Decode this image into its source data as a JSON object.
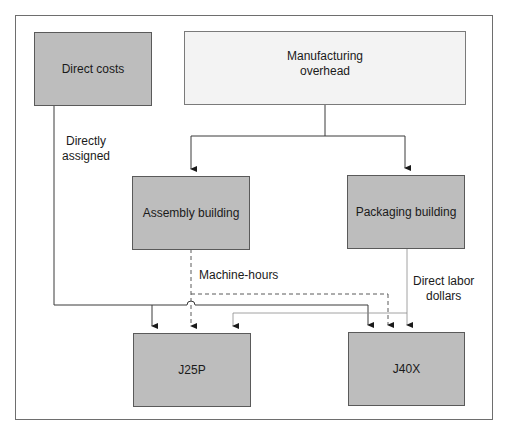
{
  "diagram": {
    "nodes": {
      "direct_costs": {
        "label": "Direct costs"
      },
      "manufacturing_overhead": {
        "label_line1": "Manufacturing",
        "label_line2": "overhead"
      },
      "assembly_building": {
        "label": "Assembly building"
      },
      "packaging_building": {
        "label": "Packaging building"
      },
      "j25p": {
        "label": "J25P"
      },
      "j40x": {
        "label": "J40X"
      }
    },
    "edge_labels": {
      "directly_assigned_line1": "Directly",
      "directly_assigned_line2": "assigned",
      "machine_hours": "Machine-hours",
      "direct_labor_line1": "Direct labor",
      "direct_labor_line2": "dollars"
    },
    "edges": [
      {
        "from": "Manufacturing overhead",
        "to": "Assembly building",
        "style": "solid"
      },
      {
        "from": "Manufacturing overhead",
        "to": "Packaging building",
        "style": "solid"
      },
      {
        "from": "Direct costs",
        "to": "J25P",
        "style": "solid",
        "label": "Directly assigned"
      },
      {
        "from": "Direct costs",
        "to": "J40X",
        "style": "solid",
        "label": "Directly assigned"
      },
      {
        "from": "Assembly building",
        "to": "J25P",
        "style": "dashed",
        "label": "Machine-hours"
      },
      {
        "from": "Assembly building",
        "to": "J40X",
        "style": "dashed",
        "label": "Machine-hours"
      },
      {
        "from": "Packaging building",
        "to": "J25P",
        "style": "thin-solid",
        "label": "Direct labor dollars"
      },
      {
        "from": "Packaging building",
        "to": "J40X",
        "style": "thin-solid",
        "label": "Direct labor dollars"
      }
    ],
    "colors": {
      "dark_box": "#bdbdbd",
      "light_box": "#f3f3f3",
      "line": "#3a3a3a",
      "thin_line": "#8a8a8a",
      "frame": "#6e6e6e"
    }
  }
}
